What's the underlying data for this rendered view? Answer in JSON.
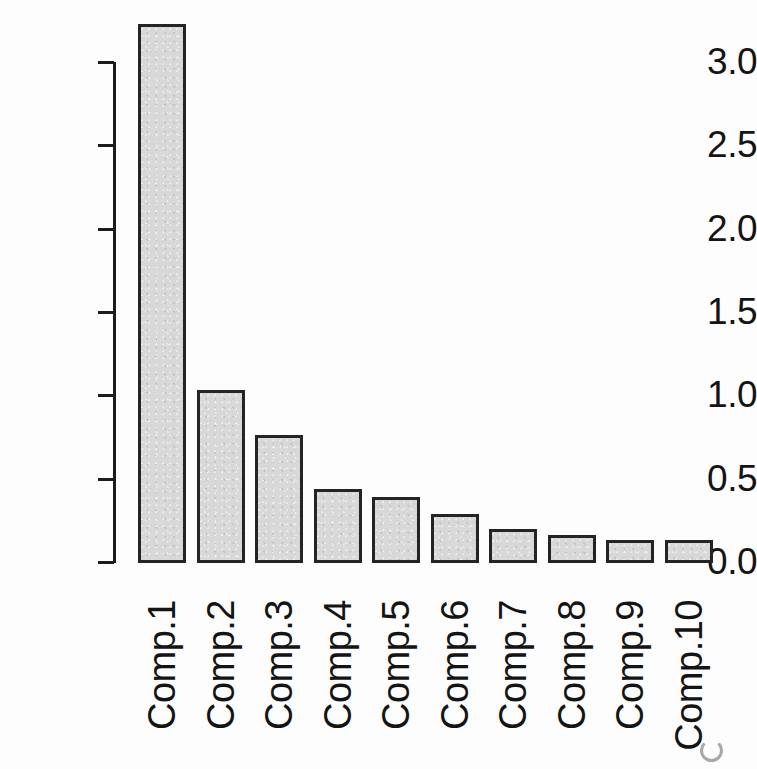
{
  "figure": {
    "kind": "scree-plot",
    "background_color": "#fdfdfd",
    "bar_fill_color": "#d8d8d8",
    "bar_border_color": "#242424",
    "axis_color": "#1c1c1c",
    "text_color": "#141414"
  },
  "chart_data": {
    "type": "bar",
    "title": "",
    "subtitle": "",
    "xlabel": "",
    "ylabel": "",
    "categories": [
      "Comp.1",
      "Comp.2",
      "Comp.3",
      "Comp.4",
      "Comp.5",
      "Comp.6",
      "Comp.7",
      "Comp.8",
      "Comp.9",
      "Comp.10"
    ],
    "values": [
      3.23,
      1.03,
      0.76,
      0.44,
      0.39,
      0.29,
      0.2,
      0.16,
      0.13,
      0.13
    ],
    "series": [
      {
        "name": "Variances",
        "values": [
          3.23,
          1.03,
          0.76,
          0.44,
          0.39,
          0.29,
          0.2,
          0.16,
          0.13,
          0.13
        ]
      }
    ],
    "ylim": [
      0.0,
      3.0
    ],
    "yticks": [
      0.0,
      0.5,
      1.0,
      1.5,
      2.0,
      2.5,
      3.0
    ],
    "ytick_labels": [
      "0.0",
      "0.5",
      "1.0",
      "1.5",
      "2.0",
      "2.5",
      "3.0"
    ],
    "grid": false,
    "legend": false,
    "legend_position": "none",
    "annotations": [],
    "x_tick_label_rotation": 90,
    "note": "Bar for Comp.1 extends above the topmost 3.0 tick."
  },
  "axis": {
    "y_tick_labels": [
      "3.0",
      "2.5",
      "2.0",
      "1.5",
      "1.0",
      "0.5",
      "0.0"
    ]
  },
  "bars": [
    {
      "label": "Comp.1",
      "value": 3.23
    },
    {
      "label": "Comp.2",
      "value": 1.03
    },
    {
      "label": "Comp.3",
      "value": 0.76
    },
    {
      "label": "Comp.4",
      "value": 0.44
    },
    {
      "label": "Comp.5",
      "value": 0.39
    },
    {
      "label": "Comp.6",
      "value": 0.29
    },
    {
      "label": "Comp.7",
      "value": 0.2
    },
    {
      "label": "Comp.8",
      "value": 0.16
    },
    {
      "label": "Comp.9",
      "value": 0.13
    },
    {
      "label": "Comp.10",
      "value": 0.13
    }
  ],
  "page_bleed": {
    "text": "",
    "visible": true
  }
}
